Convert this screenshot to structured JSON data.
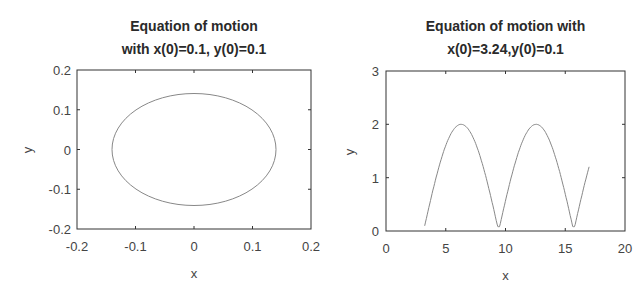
{
  "chart_data": [
    {
      "type": "line",
      "title_line1": "Equation of motion",
      "title_line2": "with x(0)=0.1, y(0)=0.1",
      "xlabel": "x",
      "ylabel": "y",
      "xlim": [
        -0.2,
        0.2
      ],
      "ylim": [
        -0.2,
        0.2
      ],
      "xticks": [
        "-0.2",
        "-0.1",
        "0",
        "0.1",
        "0.2"
      ],
      "yticks": [
        "-0.2",
        "-0.1",
        "0",
        "0.1",
        "0.2"
      ],
      "grid": false,
      "series": [
        {
          "name": "trajectory",
          "shape": "closed ellipse",
          "center": [
            0,
            0
          ],
          "radius_x": 0.14,
          "radius_y": 0.14,
          "color": "#888888"
        }
      ]
    },
    {
      "type": "line",
      "title_line1": "Equation of motion with",
      "title_line2": "x(0)=3.24,y(0)=0.1",
      "xlabel": "x",
      "ylabel": "y",
      "xlim": [
        0,
        20
      ],
      "ylim": [
        0,
        3
      ],
      "xticks": [
        "0",
        "5",
        "10",
        "15",
        "20"
      ],
      "yticks": [
        "0",
        "1",
        "2",
        "3"
      ],
      "grid": false,
      "series": [
        {
          "name": "trajectory",
          "x": [
            3.24,
            4.0,
            5.0,
            6.28,
            7.5,
            8.5,
            9.42,
            10.5,
            11.5,
            12.57,
            13.8,
            14.8,
            15.71,
            16.5,
            17.0
          ],
          "y": [
            0.1,
            0.83,
            1.6,
            2.0,
            1.64,
            0.9,
            0.08,
            1.04,
            1.73,
            2.0,
            1.57,
            0.74,
            0.15,
            0.77,
            1.1
          ],
          "color": "#888888"
        }
      ]
    }
  ]
}
